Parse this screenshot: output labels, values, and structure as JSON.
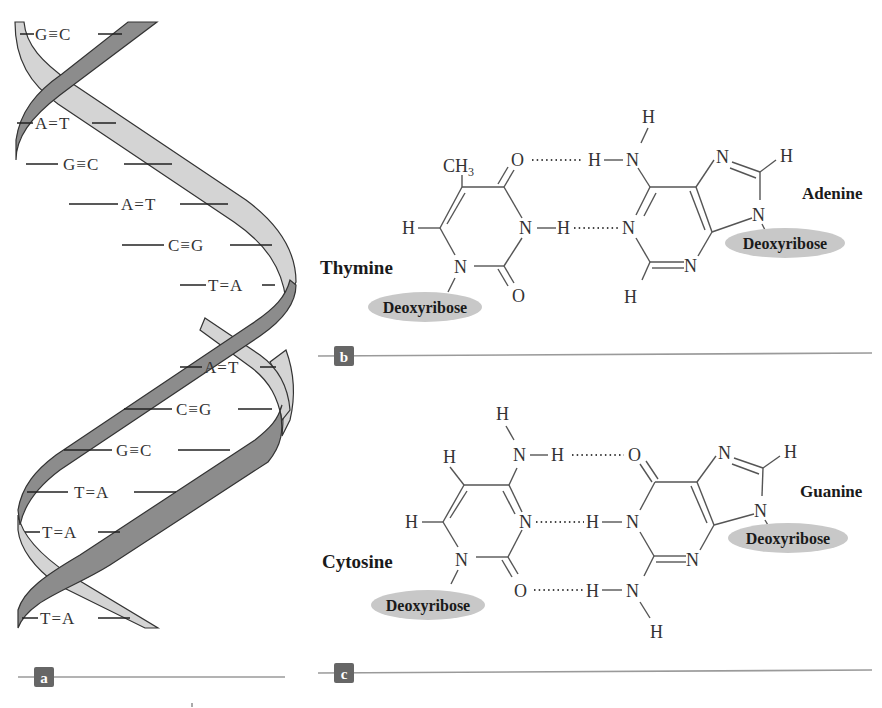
{
  "figure": {
    "panels": [
      {
        "id": "a",
        "label": "a",
        "title": "DNA double helix"
      },
      {
        "id": "b",
        "label": "b",
        "title": "Thymine–Adenine pair"
      },
      {
        "id": "c",
        "label": "c",
        "title": "Cytosine–Guanine pair"
      }
    ],
    "colors": {
      "strand_dark": "#8c8c8c",
      "strand_light": "#d4d4d4",
      "outline": "#333333",
      "sugar_ellipse": "#c8c8c8",
      "label_box": "#666666",
      "divider": "#9a9a9a"
    }
  },
  "helix": {
    "base_pairs": [
      {
        "left": "G",
        "bond": "≡",
        "right": "C"
      },
      {
        "left": "A",
        "bond": "=",
        "right": "T"
      },
      {
        "left": "G",
        "bond": "≡",
        "right": "C"
      },
      {
        "left": "A",
        "bond": "=",
        "right": "T"
      },
      {
        "left": "C",
        "bond": "≡",
        "right": "G"
      },
      {
        "left": "T",
        "bond": "=",
        "right": "A"
      },
      {
        "left": "A",
        "bond": "=",
        "right": "T"
      },
      {
        "left": "C",
        "bond": "≡",
        "right": "G"
      },
      {
        "left": "G",
        "bond": "≡",
        "right": "C"
      },
      {
        "left": "T",
        "bond": "=",
        "right": "A"
      },
      {
        "left": "T",
        "bond": "=",
        "right": "A"
      },
      {
        "left": "T",
        "bond": "=",
        "right": "A"
      }
    ]
  },
  "pair_b": {
    "left_base": "Thymine",
    "right_base": "Adenine",
    "sugar_left": "Deoxyribose",
    "sugar_right": "Deoxyribose",
    "atoms": {
      "ch3": "CH",
      "ch3_sub": "3",
      "o_top": "O",
      "o_bottom": "O",
      "n_ring": "N",
      "n1": "N",
      "h_left": "H",
      "h_imino": "H",
      "h_amino_top": "H",
      "h_amino": "H",
      "n_amino": "N",
      "n_acceptor": "N",
      "n_bottom": "N",
      "h_bottom": "H",
      "n7": "N",
      "h8": "H",
      "n9": "N"
    }
  },
  "pair_c": {
    "left_base": "Cytosine",
    "right_base": "Guanine",
    "sugar_left": "Deoxyribose",
    "sugar_right": "Deoxyribose",
    "atoms": {
      "h_amino_top": "H",
      "n_amino": "N",
      "h_amino": "H",
      "h5": "H",
      "h6": "H",
      "n3": "N",
      "n1": "N",
      "o2": "O",
      "o6": "O",
      "h_n1g": "H",
      "n1g": "N",
      "h_n2": "H",
      "n2": "N",
      "h_n2_bottom": "H",
      "n3g": "N",
      "n7": "N",
      "h8": "H",
      "n9": "N"
    }
  }
}
